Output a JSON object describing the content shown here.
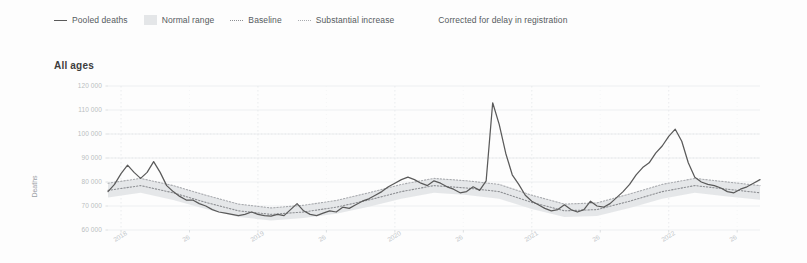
{
  "legend": {
    "items": [
      {
        "label": "Pooled deaths",
        "swatch": "solid-line-swatch"
      },
      {
        "label": "Normal range",
        "swatch": "shaded-band-swatch"
      },
      {
        "label": "Baseline",
        "swatch": "dotted-line-swatch"
      },
      {
        "label": "Substantial increase",
        "swatch": "dotted-line-swatch"
      },
      {
        "label": "Corrected for delay in registration",
        "swatch": "no-swatch"
      }
    ]
  },
  "panel": {
    "title": "All ages"
  },
  "colors": {
    "pooled_deaths": "#5a5a5a",
    "normal_range": "#e4e6e8",
    "baseline": "#8d8f93",
    "substantial_increase": "#a9abaf",
    "gridline": "#e9ebed",
    "axis_text": "#b9bdc1",
    "panel_background": "#fdfdfd"
  },
  "chart_data": {
    "type": "line",
    "title": "All ages",
    "xlabel": "",
    "ylabel": "Deaths",
    "ylim": [
      60000,
      120000
    ],
    "ytick_values": [
      60000,
      70000,
      80000,
      90000,
      100000,
      110000,
      120000
    ],
    "ytick_labels": [
      "60 000",
      "70 000",
      "80 000",
      "90 000",
      "100 000",
      "110 000",
      "120 000"
    ],
    "grid": true,
    "legend_position": "top",
    "xlim": [
      0,
      100
    ],
    "xtick_positions": [
      2,
      12.5,
      23,
      33.5,
      44,
      54.5,
      65,
      75.5,
      86,
      96.5
    ],
    "xtick_labels": [
      "2018",
      "26",
      "2019",
      "26",
      "2020",
      "26",
      "2021",
      "26",
      "2022",
      "26"
    ],
    "x_unit": "week",
    "series": [
      {
        "name": "Pooled deaths",
        "style": "solid",
        "color": "#5a5a5a",
        "x": [
          0,
          1,
          2,
          3,
          4,
          5,
          6,
          7,
          8,
          9,
          10,
          11,
          12,
          13,
          14,
          15,
          16,
          17,
          18,
          19,
          20,
          21,
          22,
          23,
          24,
          25,
          26,
          27,
          28,
          29,
          30,
          31,
          32,
          33,
          34,
          35,
          36,
          37,
          38,
          39,
          40,
          41,
          42,
          43,
          44,
          45,
          46,
          47,
          48,
          49,
          50,
          51,
          52,
          53,
          54,
          55,
          56,
          57,
          58,
          59,
          60,
          61,
          62,
          63,
          64,
          65,
          66,
          67,
          68,
          69,
          70,
          71,
          72,
          73,
          74,
          75,
          76,
          77,
          78,
          79,
          80,
          81,
          82,
          83,
          84,
          85,
          86,
          87,
          88,
          89,
          90,
          91,
          92,
          93,
          94,
          95,
          96,
          97,
          98,
          99,
          100
        ],
        "values": [
          76000,
          79000,
          83500,
          87000,
          84000,
          81500,
          84000,
          88500,
          84000,
          78500,
          76000,
          74000,
          72500,
          72500,
          71000,
          70000,
          68500,
          67500,
          67000,
          66500,
          66000,
          66500,
          67500,
          66500,
          66000,
          65800,
          66500,
          66000,
          68500,
          71000,
          68000,
          66500,
          66000,
          67000,
          68000,
          67500,
          69500,
          69000,
          70500,
          72000,
          73000,
          74500,
          76000,
          78000,
          79500,
          81000,
          82000,
          81000,
          79500,
          78500,
          80500,
          79500,
          78000,
          77000,
          75500,
          76000,
          78000,
          76500,
          80500,
          113000,
          104000,
          92000,
          83000,
          79000,
          74500,
          72000,
          70500,
          69000,
          68000,
          68500,
          70500,
          68500,
          67500,
          68500,
          72000,
          70000,
          69500,
          71000,
          73500,
          76000,
          79000,
          83000,
          86000,
          88000,
          92000,
          95000,
          99000,
          102000,
          97000,
          88000,
          82000,
          80000,
          79000,
          78500,
          77500,
          76000,
          75500,
          77000,
          78000,
          79500,
          81000
        ]
      },
      {
        "name": "Baseline",
        "style": "dotted",
        "color": "#8d8f93",
        "x": [
          0,
          5,
          10,
          15,
          20,
          25,
          30,
          35,
          40,
          45,
          50,
          55,
          60,
          65,
          70,
          75,
          80,
          85,
          90,
          95,
          100
        ],
        "values": [
          76500,
          78500,
          75500,
          71500,
          68000,
          66500,
          67500,
          69500,
          72500,
          76000,
          78500,
          77500,
          76000,
          71500,
          68000,
          68500,
          72000,
          76000,
          78500,
          77000,
          75500
        ]
      },
      {
        "name": "Substantial increase",
        "style": "dotted",
        "color": "#a9abaf",
        "x": [
          0,
          5,
          10,
          15,
          20,
          25,
          30,
          35,
          40,
          45,
          50,
          55,
          60,
          65,
          70,
          75,
          80,
          85,
          90,
          95,
          100
        ],
        "values": [
          79500,
          81500,
          78500,
          74500,
          70800,
          69200,
          70300,
          72300,
          75500,
          79000,
          81500,
          80500,
          79000,
          74500,
          70800,
          71300,
          75000,
          79000,
          81500,
          80000,
          78500
        ]
      },
      {
        "name": "Normal range lower bound",
        "style": "band-lower",
        "color": "#e4e6e8",
        "x": [
          0,
          5,
          10,
          15,
          20,
          25,
          30,
          35,
          40,
          45,
          50,
          55,
          60,
          65,
          70,
          75,
          80,
          85,
          90,
          95,
          100
        ],
        "values": [
          73500,
          75500,
          72500,
          68700,
          65400,
          64000,
          65000,
          66800,
          69700,
          73000,
          75500,
          74600,
          73000,
          68700,
          65400,
          65800,
          69200,
          73000,
          75500,
          74000,
          72600
        ]
      }
    ],
    "annotations": [
      {
        "label": "COVID-19 first wave peak",
        "x": 59,
        "y": 113000
      },
      {
        "label": "COVID-19 winter wave peak",
        "x": 87,
        "y": 102000
      }
    ]
  }
}
